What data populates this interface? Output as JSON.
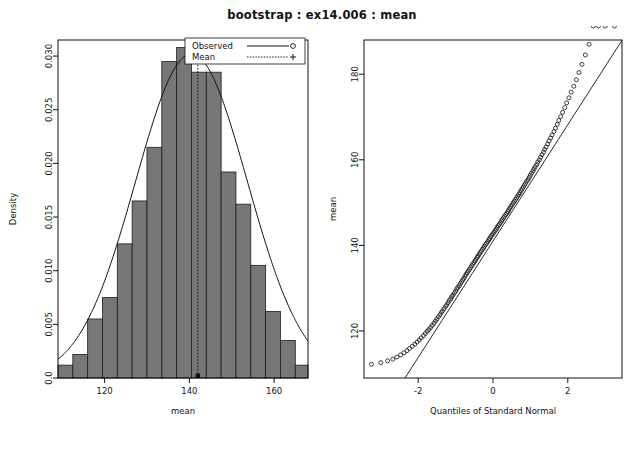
{
  "figure": {
    "title": "bootstrap : ex14.006 : mean",
    "bar_fill_color": "#777777",
    "bar_edge_color": "#1d1d1d",
    "line_color": "#111111",
    "background_color": "#ffffff"
  },
  "chart_data": [
    {
      "type": "bar",
      "panel": "left",
      "subtype": "histogram-with-density",
      "title": "",
      "xlabel": "mean",
      "ylabel": "Density",
      "xlim": [
        109,
        168
      ],
      "ylim": [
        0,
        0.0315
      ],
      "grid": false,
      "xticks": [
        120,
        140,
        160,
        180
      ],
      "xticklabels": [
        "120",
        "140",
        "160",
        "180"
      ],
      "yticks": [
        0.0,
        0.005,
        0.01,
        0.015,
        0.02,
        0.025,
        0.03
      ],
      "yticklabels": [
        "0.0",
        "0.005",
        "0.010",
        "0.015",
        "0.020",
        "0.025",
        "0.030"
      ],
      "bin_edges": [
        109,
        112.5,
        116,
        119.5,
        123,
        126.5,
        130,
        133.5,
        137,
        140.5,
        144,
        147.5,
        151,
        154.5,
        158,
        161.5,
        165,
        168
      ],
      "values": [
        0.0012,
        0.0022,
        0.0055,
        0.0075,
        0.0125,
        0.0165,
        0.0215,
        0.0295,
        0.0308,
        0.0285,
        0.0285,
        0.0192,
        0.0162,
        0.0105,
        0.0062,
        0.0035,
        0.0012
      ],
      "mean_value": 142.0,
      "density_curve": {
        "label": "normal density overlay",
        "mu": 140.5,
        "sigma": 13.2,
        "peak_density": 0.0302
      },
      "legend": {
        "position": "top-right",
        "entries": [
          {
            "label": "Observed",
            "style": "solid-line",
            "marker": "circle"
          },
          {
            "label": "Mean",
            "style": "dotted-line",
            "marker": "plus"
          }
        ]
      }
    },
    {
      "type": "scatter",
      "panel": "right",
      "subtype": "normal-qq-plot",
      "title": "",
      "xlabel": "Quantiles of Standard Normal",
      "ylabel": "mean",
      "xlim": [
        -3.45,
        3.45
      ],
      "ylim": [
        109,
        188
      ],
      "grid": false,
      "xticks": [
        -2,
        0,
        2
      ],
      "xticklabels": [
        "-2",
        "0",
        "2"
      ],
      "yticks": [
        120,
        140,
        160,
        180
      ],
      "yticklabels": [
        "120",
        "140",
        "160",
        "180"
      ],
      "reference_line": {
        "intercept": 141.0,
        "slope": 13.6
      },
      "marker": "open-circle",
      "shape_note": "right-skewed: both tails bow above the reference line",
      "x": [
        -3.25,
        -3.0,
        -2.82,
        -2.68,
        -2.57,
        -2.47,
        -2.38,
        -2.3,
        -2.23,
        -2.16,
        -2.09,
        -2.03,
        -1.97,
        -1.92,
        -1.86,
        -1.81,
        -1.76,
        -1.72,
        -1.67,
        -1.63,
        -1.58,
        -1.54,
        -1.5,
        -1.46,
        -1.42,
        -1.38,
        -1.35,
        -1.31,
        -1.27,
        -1.24,
        -1.2,
        -1.17,
        -1.13,
        -1.1,
        -1.07,
        -1.03,
        -1.0,
        -0.97,
        -0.94,
        -0.9,
        -0.87,
        -0.84,
        -0.81,
        -0.78,
        -0.75,
        -0.72,
        -0.69,
        -0.66,
        -0.63,
        -0.6,
        -0.57,
        -0.54,
        -0.51,
        -0.48,
        -0.45,
        -0.42,
        -0.4,
        -0.37,
        -0.34,
        -0.31,
        -0.28,
        -0.25,
        -0.23,
        -0.2,
        -0.17,
        -0.14,
        -0.11,
        -0.09,
        -0.06,
        -0.03,
        0.0,
        0.03,
        0.06,
        0.09,
        0.11,
        0.14,
        0.17,
        0.2,
        0.23,
        0.25,
        0.28,
        0.31,
        0.34,
        0.37,
        0.4,
        0.42,
        0.45,
        0.48,
        0.51,
        0.54,
        0.57,
        0.6,
        0.63,
        0.66,
        0.69,
        0.72,
        0.75,
        0.78,
        0.81,
        0.84,
        0.87,
        0.9,
        0.94,
        0.97,
        1.0,
        1.03,
        1.07,
        1.1,
        1.13,
        1.17,
        1.2,
        1.24,
        1.27,
        1.31,
        1.35,
        1.38,
        1.42,
        1.46,
        1.5,
        1.54,
        1.58,
        1.63,
        1.67,
        1.72,
        1.76,
        1.81,
        1.86,
        1.92,
        1.97,
        2.03,
        2.09,
        2.16,
        2.23,
        2.3,
        2.38,
        2.47,
        2.57,
        2.68,
        2.82,
        3.0,
        3.25
      ],
      "y": [
        112.2,
        112.6,
        113.0,
        113.4,
        113.9,
        114.4,
        114.9,
        115.4,
        115.9,
        116.4,
        116.9,
        117.4,
        117.9,
        118.4,
        118.9,
        119.4,
        119.9,
        120.3,
        120.8,
        121.3,
        121.8,
        122.3,
        122.8,
        123.3,
        123.8,
        124.3,
        124.7,
        125.2,
        125.7,
        126.1,
        126.6,
        127.1,
        127.5,
        128.0,
        128.4,
        128.9,
        129.3,
        129.8,
        130.2,
        130.6,
        131.1,
        131.5,
        131.9,
        132.3,
        132.8,
        133.2,
        133.6,
        134.0,
        134.4,
        134.8,
        135.2,
        135.6,
        136.0,
        136.4,
        136.8,
        137.2,
        137.5,
        137.9,
        138.3,
        138.7,
        139.1,
        139.4,
        139.8,
        140.2,
        140.5,
        140.9,
        141.3,
        141.6,
        142.0,
        142.4,
        142.7,
        143.1,
        143.5,
        143.8,
        144.2,
        144.6,
        144.9,
        145.3,
        145.7,
        146.0,
        146.4,
        146.8,
        147.2,
        147.5,
        147.9,
        148.3,
        148.7,
        149.1,
        149.5,
        149.9,
        150.3,
        150.7,
        151.1,
        151.5,
        151.9,
        152.3,
        152.8,
        153.2,
        153.6,
        154.1,
        154.5,
        155.0,
        155.4,
        155.9,
        156.4,
        156.9,
        157.4,
        157.9,
        158.4,
        158.9,
        159.5,
        160.0,
        160.6,
        161.2,
        161.8,
        162.4,
        163.0,
        163.7,
        164.4,
        165.1,
        165.8,
        166.6,
        167.4,
        168.3,
        169.2,
        170.1,
        171.1,
        172.2,
        173.3,
        174.5,
        175.8,
        177.2,
        178.7,
        180.4,
        182.3,
        184.5,
        187.0
      ]
    }
  ]
}
